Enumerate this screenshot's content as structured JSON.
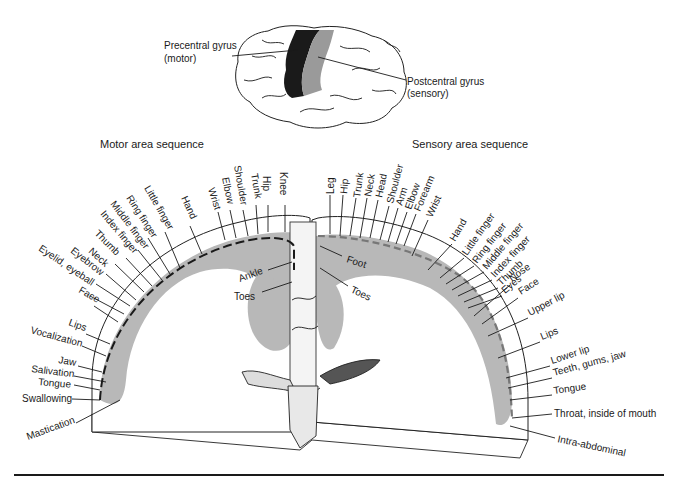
{
  "brain": {
    "precentral_label_1": "Precentral gyrus",
    "precentral_label_2": "(motor)",
    "postcentral_label_1": "Postcentral gyrus",
    "postcentral_label_2": "(sensory)",
    "colors": {
      "motor": "#1a1a1a",
      "sensory": "#9a9a9a",
      "cortex_shade": "#b8b8b8"
    }
  },
  "motor": {
    "heading": "Motor area sequence",
    "labels": [
      "Knee",
      "Hip",
      "Trunk",
      "Shoulder",
      "Elbow",
      "Wrist",
      "Hand",
      "Little finger",
      "Ring finger",
      "Middle finger",
      "Index finger",
      "Thumb",
      "Neck",
      "Eyebrow",
      "Eyelid, eyeball",
      "Face",
      "Lips",
      "Vocalization",
      "Jaw",
      "Salivation",
      "Tongue",
      "Swallowing",
      "Mastication"
    ],
    "medial_labels": [
      "Ankle",
      "Toes"
    ]
  },
  "sensory": {
    "heading": "Sensory area sequence",
    "labels": [
      "Leg",
      "Hip",
      "Trunk",
      "Neck",
      "Head",
      "Shoulder",
      "Arm",
      "Elbow",
      "Forearm",
      "Wrist",
      "Hand",
      "Little finger",
      "Ring finger",
      "Middle finger",
      "Index finger",
      "Thumb",
      "Eyes",
      "Nose",
      "Face",
      "Upper lip",
      "Lips",
      "Lower lip",
      "Teeth, gums, jaw",
      "Tongue",
      "Throat, inside of mouth",
      "Intra-abdominal"
    ],
    "medial_labels": [
      "Foot",
      "Toes"
    ]
  }
}
